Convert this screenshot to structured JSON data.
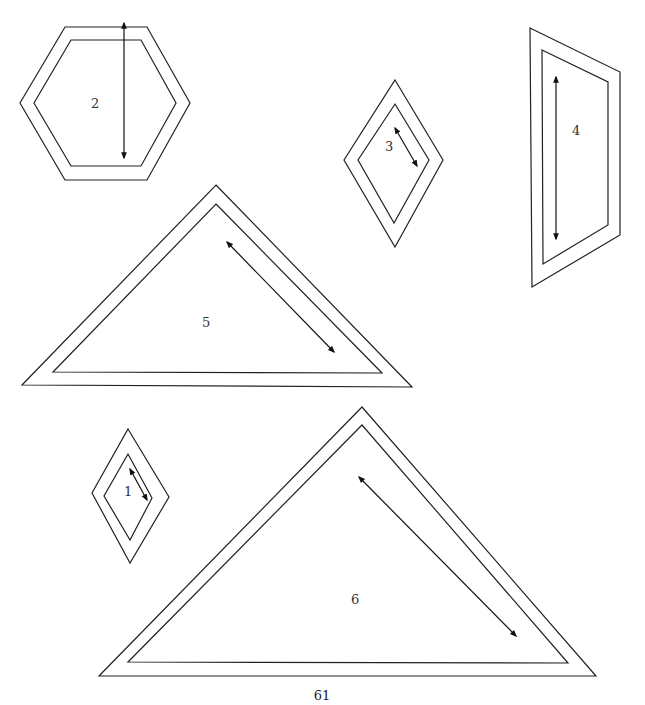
{
  "page": {
    "page_number": "61",
    "content_type": "Quilt pattern templates with seam allowance and grain-line arrows"
  },
  "templates": [
    {
      "label": "1",
      "shape": "diamond (small)",
      "grain_arrow": "diagonal"
    },
    {
      "label": "2",
      "shape": "hexagon",
      "grain_arrow": "vertical"
    },
    {
      "label": "3",
      "shape": "diamond (medium)",
      "grain_arrow": "diagonal"
    },
    {
      "label": "4",
      "shape": "trapezoid / parallelogram",
      "grain_arrow": "vertical"
    },
    {
      "label": "5",
      "shape": "triangle (medium)",
      "grain_arrow": "diagonal along right edge"
    },
    {
      "label": "6",
      "shape": "triangle (large)",
      "grain_arrow": "diagonal along right edge"
    }
  ],
  "colors": {
    "line": "#222222",
    "background": "#ffffff"
  }
}
